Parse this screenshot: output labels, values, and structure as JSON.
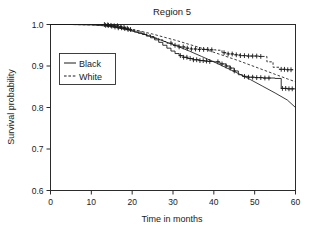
{
  "chart_data": {
    "type": "line",
    "title": "Region 5",
    "xlabel": "Time in months",
    "ylabel": "Survival probability",
    "xlim": [
      0,
      60
    ],
    "ylim": [
      0.6,
      1.0
    ],
    "xticks": [
      0,
      10,
      20,
      30,
      40,
      50,
      60
    ],
    "yticks": [
      0.6,
      0.7,
      0.8,
      0.9,
      1.0
    ],
    "xticklabels": [
      "0",
      "10",
      "20",
      "30",
      "40",
      "50",
      "60"
    ],
    "yticklabels": [
      "0.6",
      "0.7",
      "0.8",
      "0.9",
      "1.0"
    ],
    "grid": false,
    "legend_position": "upper left",
    "legend_entries": [
      {
        "label": "Black",
        "style": "solid"
      },
      {
        "label": "White",
        "style": "dashed"
      }
    ],
    "series": [
      {
        "name": "Black",
        "kind": "kaplan-meier-step",
        "style": "solid",
        "x": [
          0,
          12.5,
          13.5,
          14.5,
          15.5,
          16.5,
          17.5,
          18.5,
          19.5,
          20.5,
          21.5,
          22.5,
          23.5,
          24.5,
          25.5,
          26.5,
          27.5,
          28.5,
          29.5,
          30.5,
          31.5,
          32.5,
          33.5,
          35.0,
          36.5,
          37.5,
          38.5,
          40.0,
          41.5,
          43.0,
          44.0,
          45.0,
          46.0,
          47.0,
          48.5,
          50.0,
          52.0,
          54.0,
          55.0,
          56.5,
          58.0,
          60.0
        ],
        "y": [
          1.0,
          1.0,
          0.998,
          0.996,
          0.994,
          0.992,
          0.99,
          0.988,
          0.985,
          0.982,
          0.979,
          0.976,
          0.972,
          0.968,
          0.963,
          0.957,
          0.95,
          0.943,
          0.936,
          0.93,
          0.925,
          0.921,
          0.918,
          0.915,
          0.913,
          0.912,
          0.911,
          0.91,
          0.905,
          0.9,
          0.895,
          0.888,
          0.879,
          0.875,
          0.873,
          0.872,
          0.871,
          0.871,
          0.87,
          0.846,
          0.845,
          0.845
        ]
      },
      {
        "name": "White",
        "kind": "kaplan-meier-step",
        "style": "dashed",
        "x": [
          0,
          12.5,
          13.5,
          14.5,
          15.5,
          16.5,
          17.5,
          18.5,
          19.5,
          20.5,
          21.5,
          22.5,
          23.5,
          24.5,
          25.5,
          26.5,
          27.5,
          28.5,
          30.0,
          31.5,
          33.0,
          34.5,
          36.0,
          37.5,
          39.0,
          40.5,
          42.0,
          43.5,
          45.0,
          46.5,
          48.0,
          49.5,
          51.0,
          52.0,
          53.0,
          54.5,
          56.0,
          57.5,
          60.0
        ],
        "y": [
          1.0,
          1.0,
          0.999,
          0.998,
          0.997,
          0.995,
          0.993,
          0.991,
          0.988,
          0.985,
          0.982,
          0.979,
          0.975,
          0.971,
          0.967,
          0.963,
          0.959,
          0.955,
          0.95,
          0.946,
          0.943,
          0.941,
          0.94,
          0.94,
          0.939,
          0.938,
          0.932,
          0.929,
          0.927,
          0.925,
          0.924,
          0.924,
          0.923,
          0.923,
          0.91,
          0.897,
          0.892,
          0.891,
          0.89
        ]
      },
      {
        "name": "Black fitted",
        "kind": "smooth-fit",
        "style": "solid",
        "x": [
          0,
          5,
          10,
          13,
          16,
          19,
          22,
          25,
          28,
          31,
          34,
          37,
          40,
          43,
          46,
          49,
          52,
          55,
          58,
          60
        ],
        "y": [
          1.0,
          1.0,
          0.999,
          0.997,
          0.993,
          0.987,
          0.979,
          0.97,
          0.959,
          0.948,
          0.936,
          0.923,
          0.91,
          0.896,
          0.882,
          0.867,
          0.851,
          0.835,
          0.818,
          0.8
        ]
      },
      {
        "name": "White fitted",
        "kind": "smooth-fit",
        "style": "dashed",
        "x": [
          0,
          5,
          10,
          13,
          16,
          19,
          22,
          25,
          28,
          31,
          34,
          37,
          40,
          43,
          46,
          49,
          52,
          55,
          58,
          60
        ],
        "y": [
          1.0,
          1.0,
          0.999,
          0.998,
          0.995,
          0.99,
          0.984,
          0.977,
          0.969,
          0.961,
          0.952,
          0.943,
          0.933,
          0.923,
          0.913,
          0.902,
          0.891,
          0.88,
          0.869,
          0.862
        ]
      }
    ],
    "censor_marks": {
      "Black": [
        13.5,
        14.2,
        15.0,
        15.8,
        16.6,
        17.4,
        18.2,
        19.0,
        31.8,
        32.6,
        33.4,
        34.2,
        35.0,
        35.8,
        36.6,
        37.4,
        38.2,
        39.0,
        41.0,
        42.0,
        43.0,
        44.0,
        45.0,
        47.5,
        48.5,
        49.5,
        50.5,
        51.5,
        52.5,
        53.5,
        56.8,
        57.6,
        58.4,
        59.2
      ],
      "White": [
        13.2,
        14.0,
        14.8,
        15.6,
        16.4,
        17.2,
        18.0,
        18.8,
        19.6,
        29.5,
        30.5,
        31.5,
        32.5,
        33.5,
        34.5,
        35.5,
        36.5,
        37.5,
        38.5,
        39.5,
        42.5,
        43.5,
        44.5,
        45.5,
        46.5,
        47.5,
        48.5,
        49.5,
        50.5,
        51.5,
        56.5,
        57.3,
        58.1,
        58.9
      ]
    }
  }
}
